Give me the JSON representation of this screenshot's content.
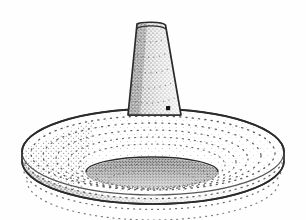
{
  "figure": {
    "title": "Stippled line drawing of a conical-shafted disc artifact",
    "caption": "",
    "domain": "technical illustration",
    "medium": "pen-and-ink stipple drawing",
    "background_color": "#fefefe",
    "ink_color": "#2b2b2b",
    "stipple_color": "#4a4a4a",
    "canvas": {
      "width": 306,
      "height": 220
    }
  },
  "view": {
    "projection": "three-quarter elevated perspective",
    "light_direction": "upper right",
    "shadow_side": "left",
    "highlight_side": "right"
  },
  "parts": [
    {
      "id": "shaft",
      "label": "conical shaft",
      "description": "tall tapering cone rising from the centre of the disc, rounded flat top with a rim line",
      "top_y": 22,
      "bottom_y": 116,
      "top_left_x": 137,
      "top_right_x": 166,
      "bottom_left_x": 128,
      "bottom_right_x": 181,
      "height_px": 94,
      "shading": "dense stipple on left, sparse on right"
    },
    {
      "id": "shaft-rim",
      "label": "shaft top rim",
      "description": "narrow elliptical rim line across the rounded apex of the cone",
      "center_x": 151,
      "center_y": 26,
      "rx": 15,
      "ry": 4
    },
    {
      "id": "disc",
      "label": "disc base",
      "description": "wide flattened torus-like base, elliptical in plan, with a vertical side wall",
      "center_x": 153,
      "center_y": 155,
      "rx": 131,
      "ry": 43,
      "wall_height": 30,
      "left_x": 22,
      "right_x": 284,
      "top_y": 112,
      "bottom_y": 206
    },
    {
      "id": "concave-top",
      "label": "concave upper surface",
      "description": "dished top face of the disc marked with concentric stipple rings",
      "ring_count": 5
    },
    {
      "id": "central-recess",
      "label": "central recess",
      "description": "dark densely stippled elliptical hollow at the centre of the disc top",
      "center_x": 152,
      "center_y": 173,
      "rx": 66,
      "ry": 15
    },
    {
      "id": "perforation-mark",
      "label": "small perforation mark",
      "description": "small solid black square mark on the right side of the shaft near its base",
      "x": 168,
      "y": 108,
      "size": 4
    }
  ],
  "annotations": {
    "scale_bar": "",
    "figure_number": "",
    "labels": []
  }
}
